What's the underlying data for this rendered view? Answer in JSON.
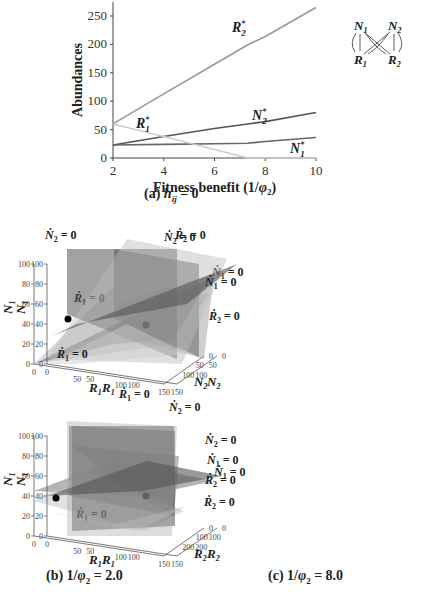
{
  "figure": {
    "panel_a": {
      "caption": "(a) h_ij = 0",
      "caption_prefix": "(a)",
      "caption_var": "h",
      "caption_sub": "ij",
      "caption_suffix": "= 0"
    },
    "panel_b": {
      "caption_prefix": "(b) 1/",
      "caption_phi": "φ",
      "caption_sub": "2",
      "caption_suffix": " = 2.0"
    },
    "panel_c": {
      "caption_prefix": "(c) 1/",
      "caption_phi": "φ",
      "caption_sub": "2",
      "caption_suffix": " = 8.0"
    },
    "diagram": {
      "nodes": [
        "N1",
        "N2",
        "R1",
        "R2"
      ],
      "edges": [
        [
          "N1",
          "R1"
        ],
        [
          "N1",
          "R2"
        ],
        [
          "N2",
          "R1"
        ],
        [
          "N2",
          "R2"
        ]
      ]
    },
    "surface_plots": [
      {
        "id": "top-left",
        "labels": [
          "Ṅ2 = 0",
          "Ṙ1 = 0",
          "Ṅ1 = 0",
          "Ṙ2 = 0"
        ],
        "y_axis": "N1",
        "x_axis": "R1",
        "z_axis": "N2",
        "y_ticks": [
          "0",
          "20",
          "40",
          "60",
          "80",
          "100"
        ],
        "x_ticks": [
          "0",
          "50",
          "100",
          "150"
        ],
        "z_ticks": [
          "0",
          "50",
          "100"
        ]
      },
      {
        "id": "top-right",
        "labels": [
          "Ṅ2 = 0",
          "Ṙ2 = 0",
          "Ṅ1 = 0",
          "Ṙ1 = 0"
        ],
        "y_axis": "N1",
        "x_axis": "R1",
        "z_axis": "N2",
        "y_ticks": [
          "0",
          "20",
          "40",
          "60",
          "80",
          "100"
        ],
        "x_ticks": [
          "0",
          "50",
          "100",
          "150"
        ],
        "z_ticks": [
          "0",
          "50",
          "100"
        ]
      },
      {
        "id": "bottom-left",
        "labels": [
          "Ṅ2 = 0",
          "Ṅ1 = 0",
          "Ṙ2 = 0",
          "Ṙ1 = 0"
        ],
        "y_axis": "N1",
        "x_axis": "R1",
        "z_axis": "R2",
        "y_ticks": [
          "0",
          "20",
          "40",
          "60",
          "80",
          "100"
        ],
        "x_ticks": [
          "0",
          "50",
          "100",
          "150"
        ],
        "z_ticks": [
          "0",
          "100",
          "200"
        ]
      },
      {
        "id": "bottom-right",
        "labels": [
          "Ṙ1 = 0",
          "Ṅ2 = 0",
          "Ṅ1 = 0",
          "Ṙ2 = 0"
        ],
        "y_axis": "N1",
        "x_axis": "R1",
        "z_axis": "R2",
        "y_ticks": [
          "0",
          "20",
          "40",
          "60",
          "80",
          "100"
        ],
        "x_ticks": [
          "0",
          "50",
          "100",
          "150"
        ],
        "z_ticks": [
          "0",
          "100",
          "200"
        ]
      }
    ]
  },
  "chart_data": {
    "type": "line",
    "xlabel": "Fitness benefit (1/φ2)",
    "ylabel": "Abundances",
    "xlim": [
      2,
      10
    ],
    "ylim": [
      0,
      270
    ],
    "x_ticks": [
      2,
      4,
      6,
      8,
      10
    ],
    "y_ticks": [
      0,
      50,
      100,
      150,
      200,
      250
    ],
    "grid": false,
    "x": [
      2,
      4,
      6,
      7.3,
      8,
      10
    ],
    "series": [
      {
        "name": "R2*",
        "values": [
          60,
          113,
          165,
          199,
          214,
          265
        ],
        "color": "#999999"
      },
      {
        "name": "N2*",
        "values": [
          23,
          38,
          52,
          60,
          64,
          80
        ],
        "color": "#555555"
      },
      {
        "name": "N1*",
        "values": [
          23,
          24,
          25,
          26,
          29,
          36
        ],
        "color": "#666666"
      },
      {
        "name": "R1*",
        "values": [
          60,
          38,
          15,
          0,
          0,
          0
        ],
        "color": "#cccccc"
      }
    ],
    "series_labels": {
      "R2": {
        "base": "R",
        "sub": "2",
        "sup": "*"
      },
      "N2": {
        "base": "N",
        "sub": "2",
        "sup": "*"
      },
      "N1": {
        "base": "N",
        "sub": "1",
        "sup": "*"
      },
      "R1": {
        "base": "R",
        "sub": "1",
        "sup": "*"
      }
    }
  }
}
